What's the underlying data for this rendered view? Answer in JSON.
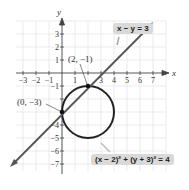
{
  "axes": {
    "x_label": "x",
    "y_label": "y"
  },
  "x_ticks": [
    "-3",
    "-2",
    "-1",
    "1",
    "2",
    "3",
    "4",
    "5",
    "6",
    "7"
  ],
  "y_ticks": [
    "3",
    "2",
    "1",
    "-1",
    "-2",
    "-3",
    "-4",
    "-5",
    "-6",
    "-7"
  ],
  "line": {
    "equation": "x − y = 3"
  },
  "circle": {
    "equation": "(x − 2)² + (y + 3)² = 4",
    "center": [
      2,
      -3
    ],
    "radius": 2
  },
  "points": [
    {
      "label": "(2, −1)",
      "x": 2,
      "y": -1
    },
    {
      "label": "(0, −3)",
      "x": 0,
      "y": -3
    }
  ],
  "colors": {
    "curve": "#222222",
    "grid": "#e6e6e6",
    "label_bg": "#d9d9d9"
  }
}
